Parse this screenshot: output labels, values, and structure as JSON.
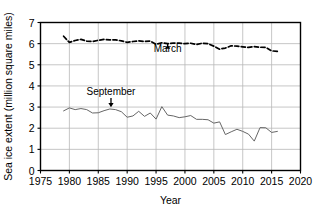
{
  "chart_data": {
    "type": "line",
    "title": "",
    "xlabel": "Year",
    "ylabel": "Sea ice extent (million square miles)",
    "xlim": [
      1975,
      2020
    ],
    "ylim": [
      0,
      7
    ],
    "xticks": [
      1975,
      1980,
      1985,
      1990,
      1995,
      2000,
      2005,
      2010,
      2015,
      2020
    ],
    "yticks": [
      0,
      1,
      2,
      3,
      4,
      5,
      6,
      7
    ],
    "grid": true,
    "legend": "none",
    "annotations": [
      {
        "label": "March",
        "x": 1997,
        "y": 5.62,
        "arrow": "up",
        "point_y": 6.0
      },
      {
        "label": "September",
        "x": 1987.2,
        "y": 3.55,
        "arrow": "down",
        "point_y": 2.95
      }
    ],
    "series": [
      {
        "name": "March",
        "style": "dashed",
        "color": "#000000",
        "x": [
          1979,
          1980,
          1981,
          1982,
          1983,
          1984,
          1985,
          1986,
          1987,
          1988,
          1989,
          1990,
          1991,
          1992,
          1993,
          1994,
          1995,
          1996,
          1997,
          1998,
          1999,
          2000,
          2001,
          2002,
          2003,
          2004,
          2005,
          2006,
          2007,
          2008,
          2009,
          2010,
          2011,
          2012,
          2013,
          2014,
          2015,
          2016
        ],
        "values": [
          6.35,
          6.06,
          6.15,
          6.2,
          6.12,
          6.1,
          6.16,
          6.2,
          6.18,
          6.18,
          6.13,
          6.06,
          6.1,
          6.13,
          6.1,
          6.12,
          5.97,
          6.04,
          6.0,
          6.03,
          6.02,
          6.0,
          6.02,
          5.96,
          6.02,
          6.0,
          5.88,
          5.74,
          5.79,
          5.9,
          5.88,
          5.85,
          5.82,
          5.86,
          5.83,
          5.82,
          5.66,
          5.63
        ]
      },
      {
        "name": "September",
        "style": "solid",
        "color": "#555555",
        "x": [
          1979,
          1980,
          1981,
          1982,
          1983,
          1984,
          1985,
          1986,
          1987,
          1988,
          1989,
          1990,
          1991,
          1992,
          1993,
          1994,
          1995,
          1996,
          1997,
          1998,
          1999,
          2000,
          2001,
          2002,
          2003,
          2004,
          2005,
          2006,
          2007,
          2008,
          2009,
          2010,
          2011,
          2012,
          2013,
          2014,
          2015,
          2016
        ],
        "values": [
          2.82,
          2.96,
          2.88,
          2.93,
          2.88,
          2.72,
          2.73,
          2.83,
          2.91,
          2.88,
          2.78,
          2.52,
          2.58,
          2.8,
          2.56,
          2.72,
          2.43,
          3.02,
          2.62,
          2.58,
          2.5,
          2.54,
          2.6,
          2.42,
          2.42,
          2.4,
          2.24,
          2.3,
          1.7,
          1.83,
          1.95,
          1.85,
          1.72,
          1.39,
          2.03,
          2.02,
          1.8,
          1.85
        ]
      }
    ]
  },
  "axis": {
    "x_tick_labels": [
      "1975",
      "1980",
      "1985",
      "1990",
      "1995",
      "2000",
      "2005",
      "2010",
      "2015",
      "2020"
    ],
    "y_tick_labels": [
      "0",
      "1",
      "2",
      "3",
      "4",
      "5",
      "6",
      "7"
    ],
    "x_title": "Year",
    "y_title": "Sea ice extent (million square miles)"
  },
  "annotations": {
    "march_label": "March",
    "september_label": "September"
  },
  "colors": {
    "axis": "#000000",
    "grid": "#b8b8b8",
    "march_line": "#000000",
    "september_line": "#666666",
    "background": "#ffffff"
  }
}
